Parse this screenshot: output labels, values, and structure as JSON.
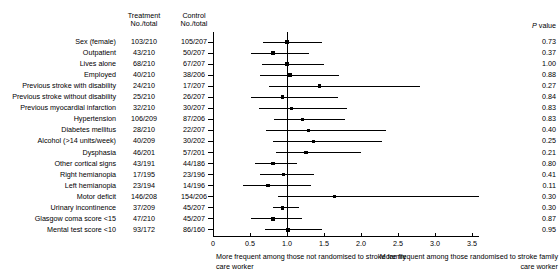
{
  "headers": {
    "treatment": "Treatment\nNo./total",
    "treatment_l1": "Treatment",
    "treatment_l2": "No./total",
    "control_l1": "Control",
    "control_l2": "No./total",
    "pvalue_italic": "P",
    "pvalue_rest": " value"
  },
  "axis": {
    "ticks": [
      "0",
      "0.5",
      "1.0",
      "1.5",
      "2.0",
      "2.5",
      "3.0",
      "3.5"
    ],
    "tick_values": [
      0,
      0.5,
      1.0,
      1.5,
      2.0,
      2.5,
      3.0,
      3.5
    ],
    "xmin": 0,
    "xmax": 3.6,
    "reference_value": 1.0,
    "note_left": "More frequent among those not randomised to stroke family care worker",
    "note_right": "More frequent among those randomised to stroke family care worker"
  },
  "chart_data": {
    "type": "forest",
    "title": "",
    "xlabel": "Odds ratio",
    "ylabel": "",
    "xlim": [
      0,
      3.6
    ],
    "reference_line": 1.0,
    "grid": false,
    "columns": [
      "Characteristic",
      "Treatment No./total",
      "Control No./total",
      "P value"
    ],
    "rows": [
      {
        "label": "Sex (female)",
        "treatment": "103/210",
        "control": "105/207",
        "estimate": 1.0,
        "lower": 0.68,
        "upper": 1.47,
        "p": "0.73"
      },
      {
        "label": "Outpatient",
        "treatment": "43/210",
        "control": "50/207",
        "estimate": 0.81,
        "lower": 0.51,
        "upper": 1.3,
        "p": "0.37"
      },
      {
        "label": "Lives alone",
        "treatment": "68/210",
        "control": "67/207",
        "estimate": 1.0,
        "lower": 0.66,
        "upper": 1.5,
        "p": "1.00"
      },
      {
        "label": "Employed",
        "treatment": "40/210",
        "control": "38/206",
        "estimate": 1.04,
        "lower": 0.63,
        "upper": 1.7,
        "p": "0.88"
      },
      {
        "label": "Previous stroke with disability",
        "treatment": "24/210",
        "control": "17/207",
        "estimate": 1.44,
        "lower": 0.75,
        "upper": 2.8,
        "p": "0.27"
      },
      {
        "label": "Previous stroke without disability",
        "treatment": "25/210",
        "control": "26/207",
        "estimate": 0.94,
        "lower": 0.52,
        "upper": 1.69,
        "p": "0.84"
      },
      {
        "label": "Previous myocardial infarction",
        "treatment": "32/210",
        "control": "30/207",
        "estimate": 1.06,
        "lower": 0.62,
        "upper": 1.81,
        "p": "0.83"
      },
      {
        "label": "Hypertension",
        "treatment": "106/209",
        "control": "87/206",
        "estimate": 1.21,
        "lower": 0.82,
        "upper": 1.78,
        "p": "0.83"
      },
      {
        "label": "Diabetes mellitus",
        "treatment": "28/210",
        "control": "22/207",
        "estimate": 1.29,
        "lower": 0.71,
        "upper": 2.34,
        "p": "0.40"
      },
      {
        "label": "Alcohol (>14 units/week)",
        "treatment": "40/209",
        "control": "30/202",
        "estimate": 1.36,
        "lower": 0.81,
        "upper": 2.28,
        "p": "0.25"
      },
      {
        "label": "Dysphasia",
        "treatment": "46/201",
        "control": "57/201",
        "estimate": 1.26,
        "lower": 0.85,
        "upper": 2.0,
        "p": "0.21"
      },
      {
        "label": "Other cortical signs",
        "treatment": "43/191",
        "control": "44/186",
        "estimate": 0.81,
        "lower": 0.57,
        "upper": 1.14,
        "p": "0.80"
      },
      {
        "label": "Right hemianopia",
        "treatment": "17/195",
        "control": "23/196",
        "estimate": 0.95,
        "lower": 0.63,
        "upper": 1.36,
        "p": "0.41"
      },
      {
        "label": "Left hemianopia",
        "treatment": "23/194",
        "control": "14/196",
        "estimate": 0.74,
        "lower": 0.4,
        "upper": 1.33,
        "p": "0.11"
      },
      {
        "label": "Motor deficit",
        "treatment": "146/208",
        "control": "154/206",
        "estimate": 1.64,
        "lower": 0.88,
        "upper": 3.6,
        "p": "0.30"
      },
      {
        "label": "Urinary incontinence",
        "treatment": "37/209",
        "control": "45/207",
        "estimate": 0.94,
        "lower": 0.81,
        "upper": 1.16,
        "p": "0.30"
      },
      {
        "label": "Glasgow coma score <15",
        "treatment": "47/210",
        "control": "45/207",
        "estimate": 0.81,
        "lower": 0.52,
        "upper": 1.2,
        "p": "0.87"
      },
      {
        "label": "Mental test score <10",
        "treatment": "93/172",
        "control": "86/160",
        "estimate": 1.01,
        "lower": 0.7,
        "upper": 1.47,
        "p": "0.95"
      }
    ]
  }
}
